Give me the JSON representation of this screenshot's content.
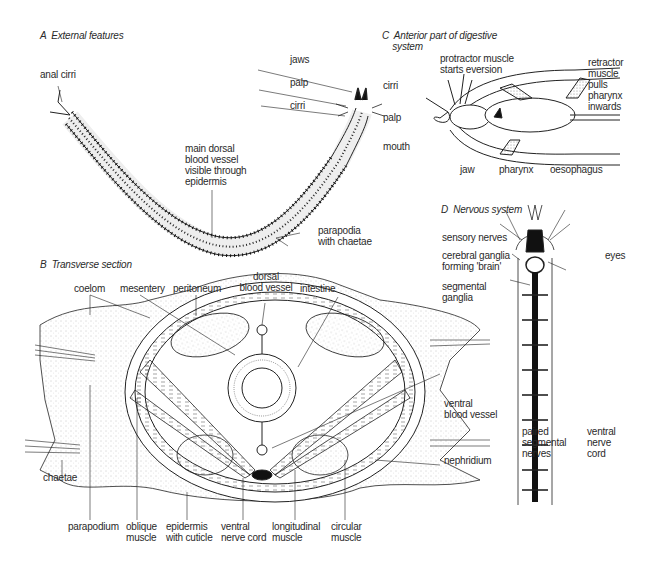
{
  "panels": {
    "A": {
      "title": "A  External features",
      "labels": {
        "anal_cirri": "anal cirri",
        "jaws": "jaws",
        "palp": "palp",
        "cirri": "cirri",
        "dorsal_vessel": "main dorsal\nblood vessel\nvisible through\nepidermis",
        "parapodia": "parapodia\nwith chaetae"
      }
    },
    "B": {
      "title": "B  Transverse section",
      "labels": {
        "coelom": "coelom",
        "mesentery": "mesentery",
        "peritoneum": "peritoneum",
        "dorsal_blood_vessel": "dorsal\nblood vessel",
        "intestine": "intestine",
        "ventral_blood_vessel": "ventral\nblood vessel",
        "nephridium": "nephridium",
        "chaetae": "chaetae",
        "parapodium": "parapodium",
        "oblique_muscle": "oblique\nmuscle",
        "epidermis": "epidermis\nwith cuticle",
        "ventral_nerve_cord": "ventral\nnerve cord",
        "longitudinal_muscle": "longitudinal\nmuscle",
        "circular_muscle": "circular\nmuscle"
      }
    },
    "C": {
      "title": "C  Anterior part of digestive\n    system",
      "labels": {
        "protractor": "protractor muscle\nstarts eversion",
        "retractor": "retractor\nmuscle\npulls\npharynx\ninwards",
        "cirri": "cirri",
        "palp": "palp",
        "mouth": "mouth",
        "jaw": "jaw",
        "pharynx": "pharynx",
        "oesophagus": "oesophagus"
      }
    },
    "D": {
      "title": "D  Nervous system",
      "labels": {
        "sensory_nerves": "sensory nerves",
        "cerebral_ganglia": "cerebral ganglia\nforming 'brain'",
        "eyes": "eyes",
        "segmental_ganglia": "segmental\nganglia",
        "paired_nerves": "paired\nsegmental\nnerves",
        "ventral_nerve_cord": "ventral\nnerve\ncord"
      }
    }
  },
  "colors": {
    "ink": "#222222",
    "stipple": "#9a9a9a",
    "background": "#ffffff"
  }
}
